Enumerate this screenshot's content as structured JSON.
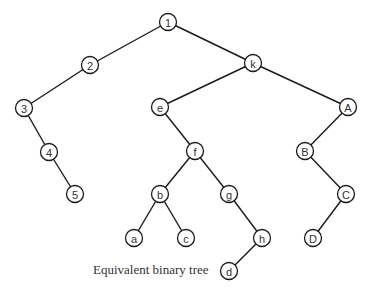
{
  "caption": "Equivalent binary tree",
  "nodes": [
    {
      "id": "1",
      "x": 168,
      "y": 22
    },
    {
      "id": "2",
      "x": 90,
      "y": 65
    },
    {
      "id": "k",
      "x": 253,
      "y": 63
    },
    {
      "id": "3",
      "x": 24,
      "y": 108
    },
    {
      "id": "e",
      "x": 160,
      "y": 107
    },
    {
      "id": "A",
      "x": 348,
      "y": 107
    },
    {
      "id": "4",
      "x": 49,
      "y": 152
    },
    {
      "id": "f",
      "x": 195,
      "y": 151
    },
    {
      "id": "B",
      "x": 305,
      "y": 151
    },
    {
      "id": "5",
      "x": 75,
      "y": 194
    },
    {
      "id": "b",
      "x": 160,
      "y": 194
    },
    {
      "id": "g",
      "x": 229,
      "y": 194
    },
    {
      "id": "C",
      "x": 346,
      "y": 194
    },
    {
      "id": "a",
      "x": 134,
      "y": 238
    },
    {
      "id": "c",
      "x": 186,
      "y": 238
    },
    {
      "id": "h",
      "x": 262,
      "y": 238
    },
    {
      "id": "D",
      "x": 313,
      "y": 238
    },
    {
      "id": "d",
      "x": 229,
      "y": 271
    }
  ],
  "edges": [
    [
      "1",
      "2"
    ],
    [
      "1",
      "k"
    ],
    [
      "2",
      "3"
    ],
    [
      "3",
      "4"
    ],
    [
      "4",
      "5"
    ],
    [
      "k",
      "e"
    ],
    [
      "k",
      "A"
    ],
    [
      "e",
      "f"
    ],
    [
      "f",
      "b"
    ],
    [
      "f",
      "g"
    ],
    [
      "b",
      "a"
    ],
    [
      "b",
      "c"
    ],
    [
      "g",
      "h"
    ],
    [
      "h",
      "d"
    ],
    [
      "A",
      "B"
    ],
    [
      "B",
      "C"
    ],
    [
      "C",
      "D"
    ]
  ]
}
